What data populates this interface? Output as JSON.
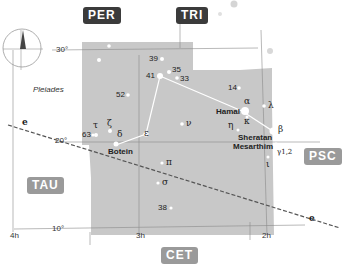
{
  "constellation_badges": {
    "per": "PER",
    "tri": "TRI",
    "psc": "PSC",
    "tau": "TAU",
    "cet": "CET"
  },
  "declination_labels": {
    "d30": "30°",
    "d20": "20°",
    "d10": "10°"
  },
  "ra_labels": {
    "h4": "4h",
    "h3": "3h",
    "h2": "2h"
  },
  "ecliptic_label": "e",
  "deep_sky": {
    "pleiades": "Pleiades"
  },
  "stars": {
    "s39": "39",
    "s35": "35",
    "s33": "33",
    "s41": "41",
    "s52": "52",
    "s14": "14",
    "s63": "63",
    "s38": "38",
    "alpha": "α",
    "hamal": "Hamal",
    "kappa": "κ",
    "eta": "η",
    "lambda": "λ",
    "beta": "β",
    "sheratan": "Sheratan",
    "mesarthim": "Mesarthim",
    "gamma": "γ1,2",
    "iota": "ι",
    "tau": "τ",
    "zeta": "ζ",
    "delta": "δ",
    "botein": "Botein",
    "epsilon": "ε",
    "nu": "ν",
    "pi": "π",
    "sigma": "σ"
  },
  "colors": {
    "constellation_area": "#c8c8c8",
    "grid_line": "#8a8a8a",
    "ecliptic": "#555555",
    "star": "#ffffff",
    "dark_badge": "#3b3b3b",
    "light_badge": "#9a9a9a"
  }
}
